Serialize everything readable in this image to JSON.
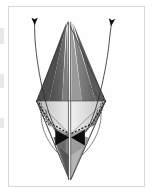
{
  "figure": {
    "type": "technical-line-diagram",
    "palette": {
      "page_background": "#ffffff",
      "panel_background": "#fefefe",
      "panel_border": "#d8d8d8",
      "ink": "#1a1a1a",
      "line": "#4a4a4a",
      "tone_darkest": "#3f3f3f",
      "tone_dark": "#595959",
      "tone_mid": "#7d7d7d",
      "tone_light": "#a8a8a8",
      "tone_lighter": "#c9c9c9",
      "tone_lightest": "#ececec",
      "highlight": "#f6f6f6",
      "edge_artifact": "#e9e9e9"
    },
    "panel": {
      "x": 8,
      "y": 6,
      "width": 137,
      "height": 181
    },
    "geometry": {
      "apex_top": [
        68,
        22
      ],
      "apex_bottom": [
        69,
        180
      ],
      "waist_left": [
        36,
        101
      ],
      "waist_right": [
        106,
        101
      ],
      "center_axis_x": 70,
      "equator_y": 101
    },
    "elements": {
      "left_arrow_label": "left deformation arrow",
      "right_arrow_label": "right deformation arrow",
      "left_arrow_tip": [
        33,
        18
      ],
      "right_arrow_tip": [
        122,
        20
      ],
      "bowtie_label": "central bowtie marker",
      "bowtie_center": [
        70,
        132
      ],
      "dotted_guide_label": "dotted fold guide",
      "equator_line_label": "horizontal equator line",
      "axis_line_label": "vertical center axis"
    },
    "facets": [
      {
        "name": "upper-left-outer",
        "tone": "#5b5b5b"
      },
      {
        "name": "upper-left-inner",
        "tone": "#8d8d8d"
      },
      {
        "name": "upper-right-outer",
        "tone": "#6a6a6a"
      },
      {
        "name": "upper-right-inner",
        "tone": "#9a9a9a"
      },
      {
        "name": "mid-left",
        "tone": "#d2d2d2"
      },
      {
        "name": "mid-right",
        "tone": "#dcdcdc"
      },
      {
        "name": "lower-left",
        "tone": "#8a8a8a"
      },
      {
        "name": "lower-right",
        "tone": "#9e9e9e"
      },
      {
        "name": "tail-left",
        "tone": "#707070"
      },
      {
        "name": "tail-right",
        "tone": "#bdbdbd"
      }
    ],
    "edge_artifacts": [
      {
        "name": "scan-artifact-1"
      },
      {
        "name": "scan-artifact-2"
      },
      {
        "name": "scan-artifact-3"
      }
    ]
  }
}
